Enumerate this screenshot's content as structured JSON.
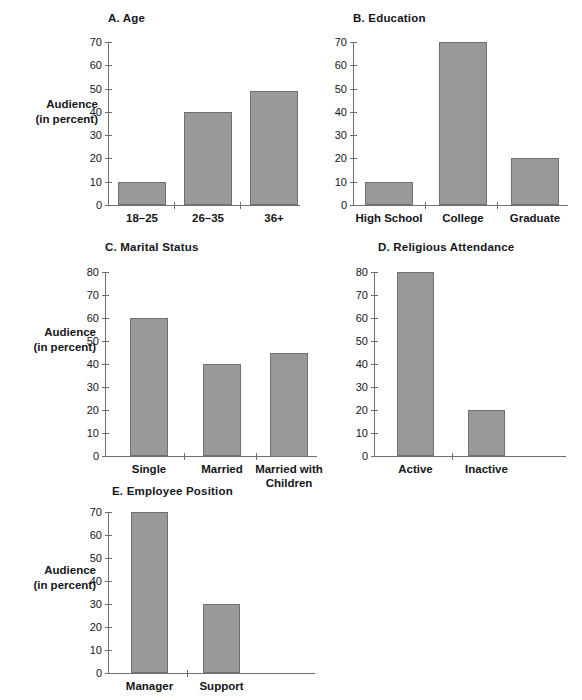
{
  "figure": {
    "y_axis_label_line1": "Audience",
    "y_axis_label_line2": "(in percent)"
  },
  "chart_data": [
    {
      "id": "A",
      "type": "bar",
      "title": "A.  Age",
      "categories": [
        "18–25",
        "26–35",
        "36+"
      ],
      "values": [
        10,
        40,
        49
      ],
      "xlabel": "",
      "ylabel": "Audience (in percent)",
      "ylim": [
        0,
        70
      ],
      "yticks": [
        0,
        10,
        20,
        30,
        40,
        50,
        60,
        70
      ],
      "grid": false,
      "legend": "none"
    },
    {
      "id": "B",
      "type": "bar",
      "title": "B.  Education",
      "categories": [
        "High School",
        "College",
        "Graduate"
      ],
      "values": [
        10,
        70,
        20
      ],
      "xlabel": "",
      "ylabel": "",
      "ylim": [
        0,
        70
      ],
      "yticks": [
        0,
        10,
        20,
        30,
        40,
        50,
        60,
        70
      ],
      "grid": false,
      "legend": "none"
    },
    {
      "id": "C",
      "type": "bar",
      "title": "C.  Marital Status",
      "categories": [
        "Single",
        "Married",
        "Married with\nChildren"
      ],
      "values": [
        60,
        40,
        45
      ],
      "xlabel": "",
      "ylabel": "Audience (in percent)",
      "ylim": [
        0,
        80
      ],
      "yticks": [
        0,
        10,
        20,
        30,
        40,
        50,
        60,
        70,
        80
      ],
      "grid": false,
      "legend": "none"
    },
    {
      "id": "D",
      "type": "bar",
      "title": "D.  Religious Attendance",
      "categories": [
        "Active",
        "Inactive"
      ],
      "values": [
        80,
        20
      ],
      "xlabel": "",
      "ylabel": "",
      "ylim": [
        0,
        80
      ],
      "yticks": [
        0,
        10,
        20,
        30,
        40,
        50,
        60,
        70,
        80
      ],
      "grid": false,
      "legend": "none"
    },
    {
      "id": "E",
      "type": "bar",
      "title": "E.  Employee Position",
      "categories": [
        "Manager",
        "Support"
      ],
      "values": [
        70,
        30
      ],
      "xlabel": "",
      "ylabel": "Audience (in percent)",
      "ylim": [
        0,
        70
      ],
      "yticks": [
        0,
        10,
        20,
        30,
        40,
        50,
        60,
        70
      ],
      "grid": false,
      "legend": "none"
    }
  ],
  "colors": {
    "bar_fill": "#97999a",
    "bar_stroke": "#6f7173",
    "axis": "#6e6f73",
    "text": "#15161a",
    "background": "#ffffff"
  },
  "panels": [
    {
      "key": "A",
      "title": "A.  Age",
      "title_pos": {
        "x": 108,
        "y": 12
      },
      "plot": {
        "x": 108,
        "y": 42,
        "w": 192,
        "h": 163
      },
      "axis_x_extra": 0,
      "ylabel": {
        "x": 14,
        "y": 97,
        "w": 84,
        "show": true
      },
      "yticks": [
        {
          "v": 70,
          "label": "70"
        },
        {
          "v": 60,
          "label": "60"
        },
        {
          "v": 50,
          "label": "50"
        },
        {
          "v": 40,
          "label": "40"
        },
        {
          "v": 30,
          "label": "30"
        },
        {
          "v": 20,
          "label": "20"
        },
        {
          "v": 10,
          "label": "10"
        },
        {
          "v": 0,
          "label": "0"
        }
      ],
      "ymax": 70,
      "bars": [
        {
          "label": "18–25",
          "value": 10,
          "x": 10,
          "w": 48
        },
        {
          "label": "26–35",
          "value": 40,
          "x": 76,
          "w": 48
        },
        {
          "label": "36+",
          "value": 49,
          "x": 142,
          "w": 48
        }
      ],
      "xticks": [
        66,
        132
      ]
    },
    {
      "key": "B",
      "title": "B.  Education",
      "title_pos": {
        "x": 353,
        "y": 12
      },
      "plot": {
        "x": 353,
        "y": 42,
        "w": 215,
        "h": 163
      },
      "axis_x_extra": 0,
      "ylabel": {
        "x": 0,
        "y": 0,
        "w": 0,
        "show": false
      },
      "yticks": [
        {
          "v": 70,
          "label": "70"
        },
        {
          "v": 60,
          "label": "60"
        },
        {
          "v": 50,
          "label": "50"
        },
        {
          "v": 40,
          "label": "40"
        },
        {
          "v": 30,
          "label": "30"
        },
        {
          "v": 20,
          "label": "20"
        },
        {
          "v": 10,
          "label": "10"
        },
        {
          "v": 0,
          "label": "0"
        }
      ],
      "ymax": 70,
      "bars": [
        {
          "label": "High School",
          "value": 10,
          "x": 12,
          "w": 48
        },
        {
          "label": "College",
          "value": 70,
          "x": 86,
          "w": 48
        },
        {
          "label": "Graduate",
          "value": 20,
          "x": 158,
          "w": 48
        }
      ],
      "xticks": [
        72,
        144
      ]
    },
    {
      "key": "C",
      "title": "C.  Marital Status",
      "title_pos": {
        "x": 105,
        "y": 241
      },
      "plot": {
        "x": 105,
        "y": 272,
        "w": 212,
        "h": 184
      },
      "axis_x_extra": 0,
      "ylabel": {
        "x": 12,
        "y": 325,
        "w": 84,
        "show": true
      },
      "yticks": [
        {
          "v": 80,
          "label": "80"
        },
        {
          "v": 70,
          "label": "70"
        },
        {
          "v": 60,
          "label": "60"
        },
        {
          "v": 50,
          "label": "50"
        },
        {
          "v": 40,
          "label": "40"
        },
        {
          "v": 30,
          "label": "30"
        },
        {
          "v": 20,
          "label": "20"
        },
        {
          "v": 10,
          "label": "10"
        },
        {
          "v": 0,
          "label": "0"
        }
      ],
      "ymax": 80,
      "bars": [
        {
          "label": "Single",
          "value": 60,
          "x": 25,
          "w": 38
        },
        {
          "label": "Married",
          "value": 40,
          "x": 98,
          "w": 38
        },
        {
          "label": "Married with\nChildren",
          "value": 45,
          "x": 165,
          "w": 38
        }
      ],
      "xticks": [
        79,
        151
      ]
    },
    {
      "key": "D",
      "title": "D.  Religious Attendance",
      "title_pos": {
        "x": 378,
        "y": 241
      },
      "plot": {
        "x": 374,
        "y": 272,
        "w": 192,
        "h": 184
      },
      "axis_x_extra": 0,
      "ylabel": {
        "x": 0,
        "y": 0,
        "w": 0,
        "show": false
      },
      "yticks": [
        {
          "v": 80,
          "label": "80"
        },
        {
          "v": 70,
          "label": "70"
        },
        {
          "v": 60,
          "label": "60"
        },
        {
          "v": 50,
          "label": "50"
        },
        {
          "v": 40,
          "label": "40"
        },
        {
          "v": 30,
          "label": "30"
        },
        {
          "v": 20,
          "label": "20"
        },
        {
          "v": 10,
          "label": "10"
        },
        {
          "v": 0,
          "label": "0"
        }
      ],
      "ymax": 80,
      "bars": [
        {
          "label": "Active",
          "value": 80,
          "x": 23,
          "w": 37
        },
        {
          "label": "Inactive",
          "value": 20,
          "x": 94,
          "w": 37
        }
      ],
      "xticks": [
        78
      ]
    },
    {
      "key": "E",
      "title": "E.  Employee Position",
      "title_pos": {
        "x": 112,
        "y": 485
      },
      "plot": {
        "x": 108,
        "y": 512,
        "w": 207,
        "h": 161
      },
      "axis_x_extra": 0,
      "ylabel": {
        "x": 12,
        "y": 563,
        "w": 84,
        "show": true
      },
      "yticks": [
        {
          "v": 70,
          "label": "70"
        },
        {
          "v": 60,
          "label": "60"
        },
        {
          "v": 50,
          "label": "50"
        },
        {
          "v": 40,
          "label": "40"
        },
        {
          "v": 30,
          "label": "30"
        },
        {
          "v": 20,
          "label": "20"
        },
        {
          "v": 10,
          "label": "10"
        },
        {
          "v": 0,
          "label": "0"
        }
      ],
      "ymax": 70,
      "bars": [
        {
          "label": "Manager",
          "value": 70,
          "x": 23,
          "w": 37
        },
        {
          "label": "Support",
          "value": 30,
          "x": 95,
          "w": 37
        }
      ],
      "xticks": [
        79
      ]
    }
  ]
}
